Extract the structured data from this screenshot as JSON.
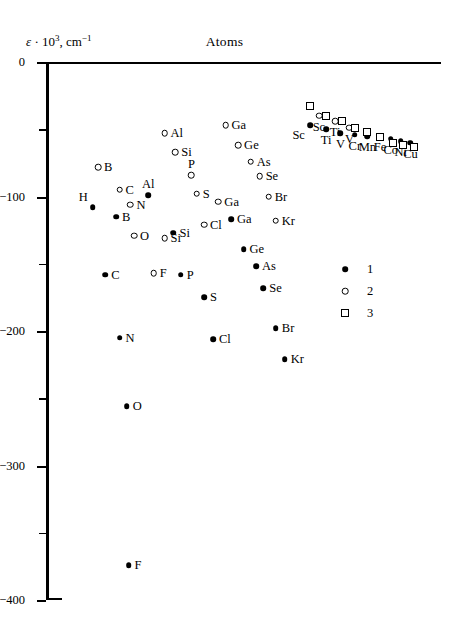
{
  "chart_data": {
    "type": "scatter",
    "title": "Atoms",
    "ylabel": "ε · 10³, cm⁻¹",
    "xlabel": "",
    "ylim": [
      -400,
      0
    ],
    "grid": false,
    "y_ticks_major": [
      "0",
      "−100",
      "−200",
      "−300",
      "−400"
    ],
    "y_tick_values_major": [
      0,
      -100,
      -200,
      -300,
      -400
    ],
    "y_tick_values_minor": [
      -50,
      -150,
      -250,
      -350
    ],
    "legend": {
      "position": "middle-right",
      "entries": [
        {
          "label": "1",
          "marker": "filled-circle"
        },
        {
          "label": "2",
          "marker": "open-circle"
        },
        {
          "label": "3",
          "marker": "open-square"
        }
      ]
    },
    "series": [
      {
        "name": "1",
        "marker": "filled-circle",
        "points": [
          {
            "label": "H",
            "x": 13.0,
            "y": -108,
            "lab": "tl"
          },
          {
            "label": "B",
            "x": 19.5,
            "y": -115,
            "lab": "r"
          },
          {
            "label": "C",
            "x": 16.5,
            "y": -158,
            "lab": "r"
          },
          {
            "label": "N",
            "x": 20.5,
            "y": -205,
            "lab": "r"
          },
          {
            "label": "O",
            "x": 22.5,
            "y": -256,
            "lab": "r"
          },
          {
            "label": "F",
            "x": 23.0,
            "y": -374,
            "lab": "r"
          },
          {
            "label": "Al",
            "x": 28.5,
            "y": -99,
            "lab": "t"
          },
          {
            "label": "Si",
            "x": 35.5,
            "y": -127,
            "lab": "r"
          },
          {
            "label": "P",
            "x": 37.5,
            "y": -158,
            "lab": "r"
          },
          {
            "label": "S",
            "x": 44.0,
            "y": -175,
            "lab": "r"
          },
          {
            "label": "Cl",
            "x": 46.5,
            "y": -206,
            "lab": "r"
          },
          {
            "label": "Ga",
            "x": 51.5,
            "y": -117,
            "lab": "r"
          },
          {
            "label": "Ge",
            "x": 55.0,
            "y": -139,
            "lab": "r"
          },
          {
            "label": "As",
            "x": 58.5,
            "y": -152,
            "lab": "r"
          },
          {
            "label": "Se",
            "x": 60.5,
            "y": -168,
            "lab": "r"
          },
          {
            "label": "Br",
            "x": 64.0,
            "y": -198,
            "lab": "r"
          },
          {
            "label": "Kr",
            "x": 66.5,
            "y": -221,
            "lab": "r"
          },
          {
            "label": "Sc",
            "x": 73.5,
            "y": -47,
            "lab": "bl"
          },
          {
            "label": "Ti",
            "x": 78.0,
            "y": -50,
            "lab": "b"
          },
          {
            "label": "V",
            "x": 82.0,
            "y": -53,
            "lab": "b"
          },
          {
            "label": "Cr",
            "x": 86.0,
            "y": -54,
            "lab": "b"
          },
          {
            "label": "Mn",
            "x": 89.5,
            "y": -55,
            "lab": "b"
          },
          {
            "label": "Fe",
            "x": 93.0,
            "y": -55,
            "lab": "b"
          },
          {
            "label": "Co",
            "x": 96.0,
            "y": -57,
            "lab": "b"
          },
          {
            "label": "Ni",
            "x": 98.8,
            "y": -59,
            "lab": "b"
          },
          {
            "label": "Cu",
            "x": 101.5,
            "y": -60,
            "lab": "b"
          }
        ]
      },
      {
        "name": "2",
        "marker": "open-circle",
        "points": [
          {
            "label": "B",
            "x": 14.5,
            "y": -78,
            "lab": "r"
          },
          {
            "label": "C",
            "x": 20.5,
            "y": -95,
            "lab": "r"
          },
          {
            "label": "N",
            "x": 23.5,
            "y": -106,
            "lab": "r"
          },
          {
            "label": "O",
            "x": 24.5,
            "y": -129,
            "lab": "r"
          },
          {
            "label": "F",
            "x": 30.0,
            "y": -157,
            "lab": "r"
          },
          {
            "label": "Al",
            "x": 33.0,
            "y": -53,
            "lab": "r"
          },
          {
            "label": "Si",
            "x": 36.0,
            "y": -67,
            "lab": "r"
          },
          {
            "label": "P",
            "x": 40.5,
            "y": -84,
            "lab": "t"
          },
          {
            "label": "S",
            "x": 42.0,
            "y": -98,
            "lab": "r"
          },
          {
            "label": "Cl",
            "x": 44.0,
            "y": -121,
            "lab": "r"
          },
          {
            "label": "Si",
            "x": 33.0,
            "y": -131,
            "lab": "r"
          },
          {
            "label": "Ga",
            "x": 50.0,
            "y": -47,
            "lab": "r"
          },
          {
            "label": "Ge",
            "x": 53.5,
            "y": -62,
            "lab": "r"
          },
          {
            "label": "As",
            "x": 57.0,
            "y": -74,
            "lab": "r"
          },
          {
            "label": "Se",
            "x": 59.5,
            "y": -85,
            "lab": "r"
          },
          {
            "label": "Ga",
            "x": 48.0,
            "y": -104,
            "lab": "r"
          },
          {
            "label": "Br",
            "x": 62.0,
            "y": -100,
            "lab": "r"
          },
          {
            "label": "Kr",
            "x": 64.0,
            "y": -118,
            "lab": "r"
          },
          {
            "label": "Sc",
            "x": 76.0,
            "y": -40,
            "lab": "b"
          },
          {
            "label": "Ti",
            "x": 80.5,
            "y": -44,
            "lab": "b"
          },
          {
            "label": "V",
            "x": 84.5,
            "y": -49,
            "lab": "b"
          }
        ]
      },
      {
        "name": "3",
        "marker": "open-square",
        "points": [
          {
            "label": "Sc",
            "x": 73.5,
            "y": -33
          },
          {
            "label": "Ti",
            "x": 78.0,
            "y": -40
          },
          {
            "label": "V",
            "x": 82.5,
            "y": -44
          },
          {
            "label": "Cr",
            "x": 86.0,
            "y": -49
          },
          {
            "label": "Mn",
            "x": 89.5,
            "y": -52
          },
          {
            "label": "Fe",
            "x": 93.0,
            "y": -56
          },
          {
            "label": "Co",
            "x": 96.5,
            "y": -60
          },
          {
            "label": "Ni",
            "x": 99.5,
            "y": -62
          },
          {
            "label": "Cu",
            "x": 102.5,
            "y": -63
          }
        ]
      }
    ]
  }
}
